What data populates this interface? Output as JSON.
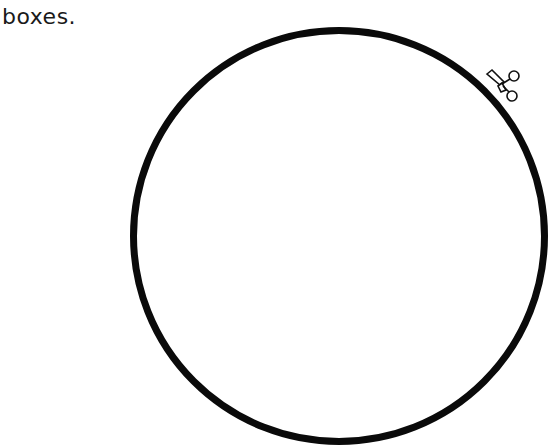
{
  "instruction_text": "boxes.",
  "cut_line": {
    "shape": "circle",
    "color": "#0a0a0a"
  },
  "icons": {
    "scissors": "scissors-icon"
  }
}
